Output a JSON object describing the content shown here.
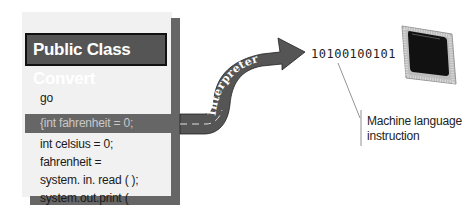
{
  "source_panel": {
    "title": "Public Class Convert",
    "code_lines": [
      "go",
      "{int fahrenheit = 0;",
      "int celsius = 0;",
      "fahrenheit =",
      "system. in. read ( );",
      "system.out.print ("
    ],
    "highlighted_line_index": 1
  },
  "interpreter": {
    "label": "Interpreter"
  },
  "output": {
    "binary": "10100100101",
    "callout": {
      "line1": "Machine language",
      "line2": "instruction"
    },
    "processor_icon": "cpu-chip-icon"
  },
  "colors": {
    "panel_bg": "#f1f1f1",
    "panel_shadow": "#666666",
    "title_bg": "#555555",
    "road": "#555555",
    "road_text": "#ffffff",
    "chip_body": "#111111"
  }
}
